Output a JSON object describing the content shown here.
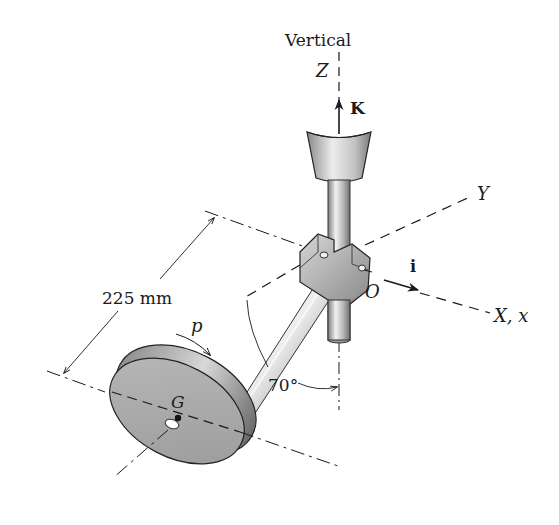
{
  "diagram": {
    "title_label": "Vertical",
    "axes": {
      "z": "Z",
      "y": "Y",
      "x": "X, x"
    },
    "unit_vectors": {
      "k": "K",
      "i": "i"
    },
    "points": {
      "origin": "O",
      "center_of_mass": "G"
    },
    "dimension": "225 mm",
    "angle": "70°",
    "spin_label": "p",
    "colors": {
      "line": "#1a1a1a",
      "disk_face": "#a9a9a9",
      "disk_rim": "#7a7a7a",
      "metal_light": "#e6e6e6",
      "metal_dark": "#8c8c8c"
    }
  }
}
